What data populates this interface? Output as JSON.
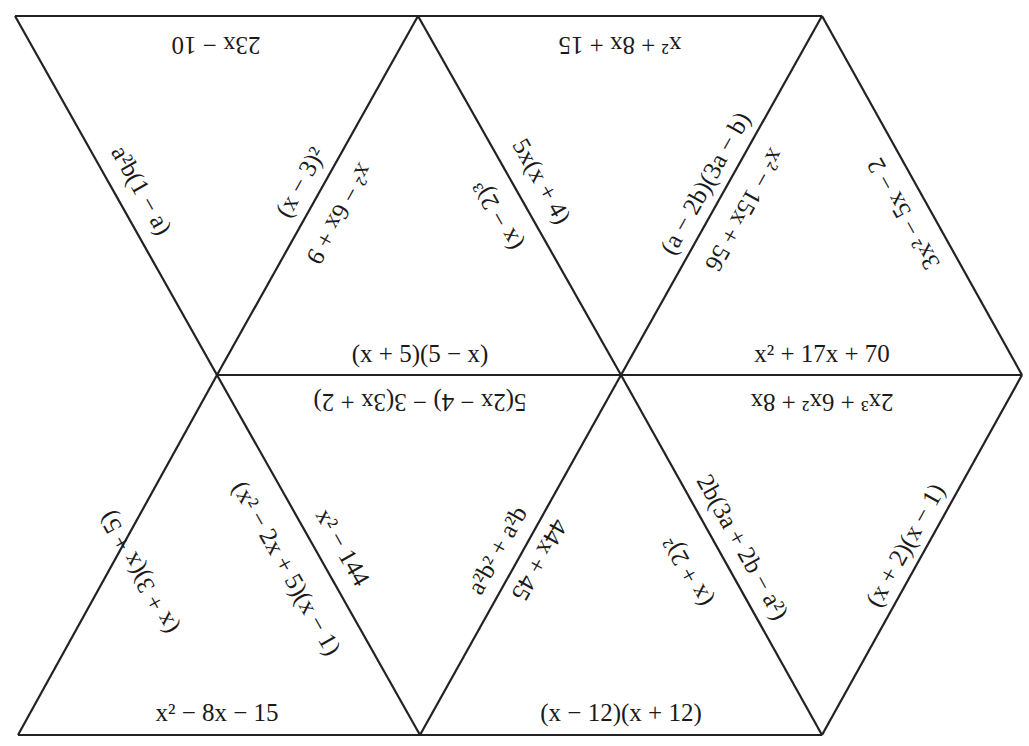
{
  "puzzle": {
    "type": "tarsia-triangle-puzzle",
    "line_color": "#222222",
    "background": "#ffffff",
    "vertices": {
      "top": [
        [
          15,
          16
        ],
        [
          418,
          16
        ],
        [
          822,
          16
        ]
      ],
      "middle": [
        [
          217,
          375
        ],
        [
          621,
          375
        ],
        [
          1022,
          375
        ]
      ],
      "bottom": [
        [
          18,
          735
        ],
        [
          420,
          735
        ],
        [
          822,
          735
        ]
      ]
    },
    "triangles": [
      {
        "id": "T1",
        "orientation": "down",
        "edges": {
          "top": "23x − 10",
          "left": "a²b(1 − a)",
          "right": "(x − 3)²"
        }
      },
      {
        "id": "T2",
        "orientation": "up",
        "edges": {
          "left": "x² − 6x + 9",
          "right": "(x − 2)³",
          "bottom": "(x + 5)(5 − x)"
        }
      },
      {
        "id": "T3",
        "orientation": "down",
        "edges": {
          "top": "x² + 8x + 15",
          "left": "5x(x + 4)",
          "right": "(a − 2b)(3a − b)"
        }
      },
      {
        "id": "T4",
        "orientation": "up",
        "edges": {
          "left": "x² − 15x + 56",
          "right": "3x² − 5x − 2",
          "bottom": "x² + 17x + 70"
        }
      },
      {
        "id": "T5",
        "orientation": "up",
        "edges": {
          "left": "(x + 3)(x + 5)",
          "right": "(x² − 2x + 5)(x − 1)",
          "bottom": "x² − 8x − 15"
        }
      },
      {
        "id": "T6",
        "orientation": "down",
        "edges": {
          "top": "5(2x − 4) − 3(3x + 2)",
          "left": "x² − 144",
          "right": "a²b² + a²b"
        }
      },
      {
        "id": "T7",
        "orientation": "up",
        "edges": {
          "left": "44x + 45",
          "right": "(x + 2)²",
          "bottom": "(x − 12)(x + 12)"
        }
      },
      {
        "id": "T8",
        "orientation": "down",
        "edges": {
          "top": "2x³ + 6x² + 8x",
          "left": "2b(3a + 2b − a²)",
          "right": "(x + 2)(x − 1)"
        }
      }
    ]
  }
}
